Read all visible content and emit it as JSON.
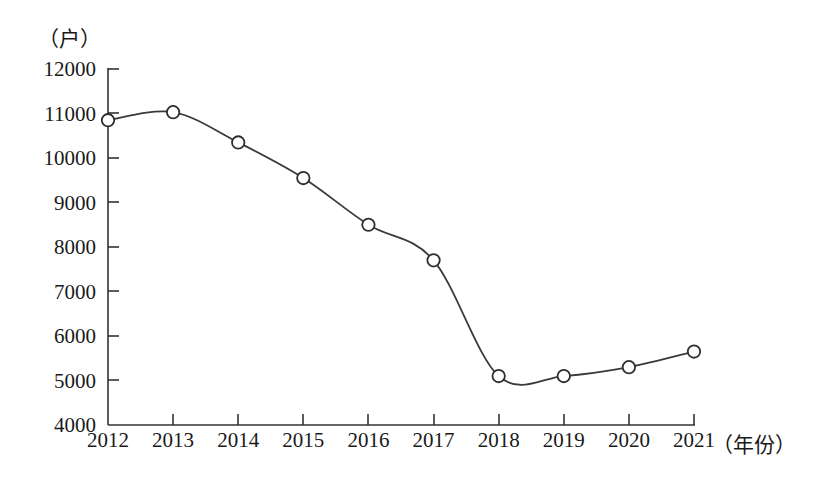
{
  "chart_data": {
    "type": "line",
    "title": "",
    "subtitle": "",
    "xlabel": "（年份）",
    "ylabel": "（户）",
    "categories": [
      "2012",
      "2013",
      "2014",
      "2015",
      "2016",
      "2017",
      "2018",
      "2019",
      "2020",
      "2021"
    ],
    "values": [
      10850,
      11030,
      10350,
      9550,
      8500,
      7700,
      5100,
      5100,
      5300,
      5650
    ],
    "series": [
      {
        "name": "户数",
        "values": [
          10850,
          11030,
          10350,
          9550,
          8500,
          7700,
          5100,
          5100,
          5300,
          5650
        ]
      }
    ],
    "ylim": [
      4000,
      12000
    ],
    "ytick_step": 1000,
    "ytick_labels": [
      "4000",
      "5000",
      "6000",
      "7000",
      "8000",
      "9000",
      "10000",
      "11000",
      "12000"
    ],
    "xtick_labels": [
      "2012",
      "2013",
      "2014",
      "2015",
      "2016",
      "2017",
      "2018",
      "2019",
      "2020",
      "2021"
    ],
    "grid": false,
    "legend": false,
    "legend_position": "none",
    "marker": "open-circle",
    "line_color": "#3a3a3a",
    "marker_fill": "#ffffff",
    "marker_stroke": "#2e2e2e",
    "smooth": true,
    "annotations": []
  },
  "axes": {
    "y_unit_label": "（户）",
    "x_unit_label": "（年份）"
  }
}
